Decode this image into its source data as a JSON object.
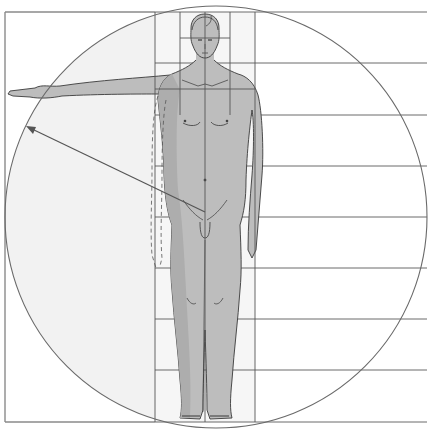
{
  "diagram": {
    "kind": "human-proportion-diagram",
    "canvas": {
      "width": 435,
      "height": 429
    },
    "colors": {
      "background": "#ffffff",
      "circle_fill": "#f3f3f3",
      "body_fill": "#bdbdbd",
      "body_fill_dark": "#a9a9a9",
      "line": "#555555",
      "grid_line": "#666666",
      "frame": "#888888"
    },
    "frame": {
      "left": 5,
      "top": 12,
      "bottom": 422,
      "right": 427
    },
    "horizontal_grid_y": [
      12,
      63,
      115,
      166,
      217,
      268,
      319,
      370,
      422
    ],
    "vertical_grid_x": [
      155,
      180,
      205,
      230,
      255
    ],
    "head_box": {
      "x": 180,
      "y": 12,
      "w": 50,
      "h": 28
    },
    "circle": {
      "cx": 216,
      "cy": 217,
      "r": 211
    },
    "arrow": {
      "from": [
        205,
        212
      ],
      "to": [
        26,
        126
      ],
      "label": ""
    },
    "figure": {
      "pose": "standing, frontal, right arm raised horizontally",
      "dashed_arm_outline": true
    }
  }
}
